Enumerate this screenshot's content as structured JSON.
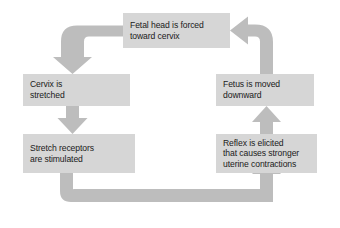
{
  "diagram": {
    "type": "cycle-flowchart",
    "title": "",
    "direction": "clockwise",
    "colors": {
      "background": "#ffffff",
      "box_fill": "#d6d6d6",
      "arrow_fill": "#bdbdbd",
      "text": "#1a1a1a"
    },
    "nodes": [
      {
        "id": "fetal-head",
        "lines": [
          "Fetal head is forced",
          "toward cervix"
        ],
        "position": "top-center"
      },
      {
        "id": "cervix",
        "lines": [
          "Cervix is",
          "stretched"
        ],
        "position": "left-upper"
      },
      {
        "id": "stretch",
        "lines": [
          "Stretch receptors",
          "are stimulated"
        ],
        "position": "left-lower"
      },
      {
        "id": "fetus",
        "lines": [
          "Fetus is moved",
          "downward"
        ],
        "position": "right-upper"
      },
      {
        "id": "reflex",
        "lines": [
          "Reflex is elicited",
          "that causes stronger",
          "uterine contractions"
        ],
        "position": "right-lower"
      }
    ],
    "edges": [
      {
        "id": "edge-fetal-head-to-cervix",
        "from": "fetal-head",
        "to": "cervix",
        "shape": "elbow-left-down",
        "arrowhead": "down"
      },
      {
        "id": "edge-cervix-to-stretch",
        "from": "cervix",
        "to": "stretch",
        "shape": "straight-vertical",
        "arrowhead": "down"
      },
      {
        "id": "edge-stretch-to-reflex",
        "from": "stretch",
        "to": "reflex",
        "shape": "elbow-down-right-up",
        "arrowhead": "up"
      },
      {
        "id": "edge-reflex-to-fetus",
        "from": "reflex",
        "to": "fetus",
        "shape": "straight-vertical",
        "arrowhead": "up"
      },
      {
        "id": "edge-fetus-to-fetal-head",
        "from": "fetus",
        "to": "fetal-head",
        "shape": "elbow-up-left",
        "arrowhead": "left"
      }
    ]
  }
}
